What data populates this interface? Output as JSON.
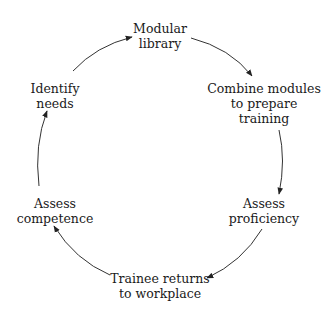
{
  "diagram": {
    "type": "cycle",
    "colors": {
      "text": "#1a1a1a",
      "arrow": "#333333",
      "background": "#ffffff"
    },
    "nodes": [
      {
        "id": "modular-library",
        "lines": [
          "Modular",
          "library"
        ]
      },
      {
        "id": "combine-modules",
        "lines": [
          "Combine modules",
          "to prepare",
          "training"
        ]
      },
      {
        "id": "assess-proficiency",
        "lines": [
          "Assess",
          "proficiency"
        ]
      },
      {
        "id": "trainee-returns",
        "lines": [
          "Trainee returns",
          "to workplace"
        ]
      },
      {
        "id": "assess-competence",
        "lines": [
          "Assess",
          "competence"
        ]
      },
      {
        "id": "identify-needs",
        "lines": [
          "Identify",
          "needs"
        ]
      }
    ],
    "edges": [
      {
        "from": "modular-library",
        "to": "combine-modules"
      },
      {
        "from": "combine-modules",
        "to": "assess-proficiency"
      },
      {
        "from": "assess-proficiency",
        "to": "trainee-returns"
      },
      {
        "from": "trainee-returns",
        "to": "assess-competence"
      },
      {
        "from": "assess-competence",
        "to": "identify-needs"
      },
      {
        "from": "identify-needs",
        "to": "modular-library"
      }
    ]
  }
}
